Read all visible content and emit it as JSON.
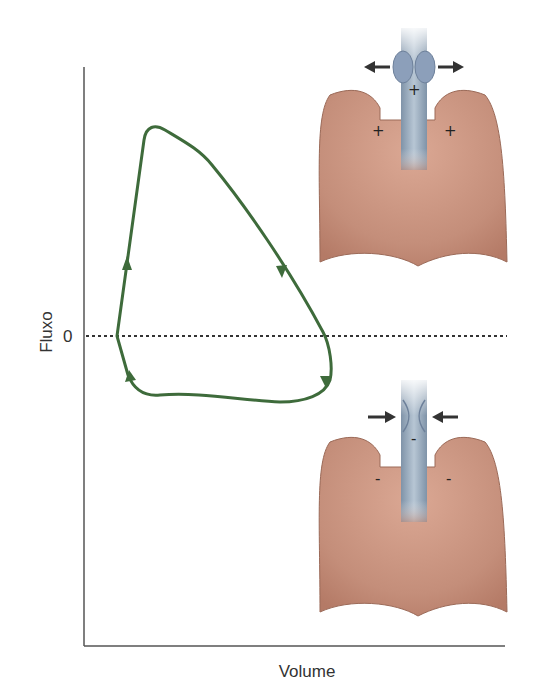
{
  "figure": {
    "y_axis_label": "Fluxo",
    "x_axis_label": "Volume",
    "zero_tick_label": "0",
    "colors": {
      "loop": "#3e6b3b",
      "axis": "#555555",
      "lung": "#c48e7a",
      "lung_edge": "#9b6a58",
      "trachea": "#8fa2b6",
      "arrow": "#333333"
    }
  },
  "top_lung": {
    "description": "expiration - positive pressure, airway dilated",
    "trachea_sign": "+",
    "left_lung_sign": "+",
    "right_lung_sign": "+",
    "arrows": "outward"
  },
  "bottom_lung": {
    "description": "inspiration - negative pressure, airway narrowed",
    "trachea_sign": "-",
    "left_lung_sign": "-",
    "right_lung_sign": "-",
    "arrows": "inward"
  }
}
